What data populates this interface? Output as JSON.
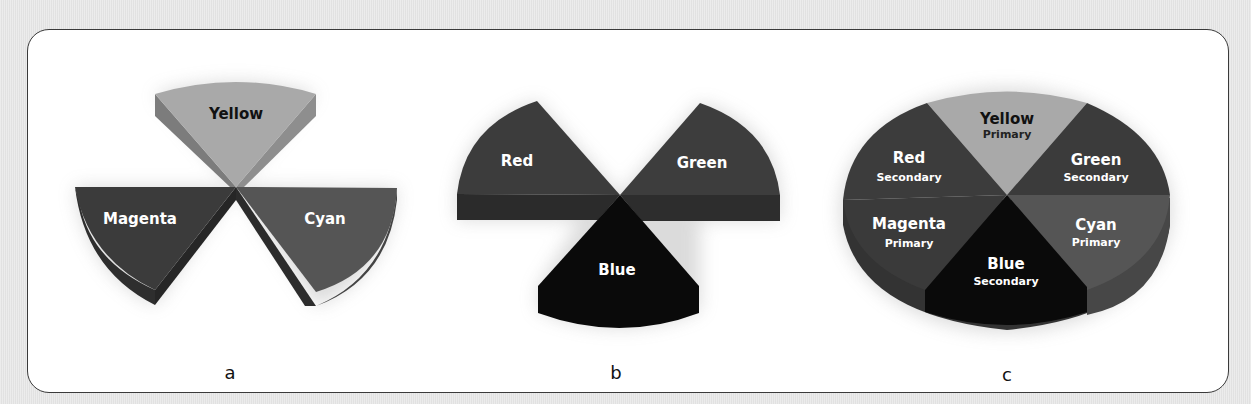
{
  "figure": {
    "panels": [
      {
        "id": "a",
        "caption": "a",
        "description": "Subtractive primaries as 3D pie wedges",
        "wedges": [
          {
            "label": "Yellow",
            "tone": "#a9a9a9"
          },
          {
            "label": "Magenta",
            "tone": "#3b3b3b"
          },
          {
            "label": "Cyan",
            "tone": "#555555"
          }
        ]
      },
      {
        "id": "b",
        "caption": "b",
        "description": "Additive primaries as wedges",
        "wedges": [
          {
            "label": "Red",
            "tone": "#3c3c3c"
          },
          {
            "label": "Green",
            "tone": "#3d3d3d"
          },
          {
            "label": "Blue",
            "tone": "#0a0a0a"
          }
        ]
      },
      {
        "id": "c",
        "caption": "c",
        "description": "Combined color wheel with primary/secondary labels",
        "wedges": [
          {
            "label": "Yellow",
            "sub": "Primary",
            "tone": "#a9a9a9"
          },
          {
            "label": "Green",
            "sub": "Secondary",
            "tone": "#3b3b3b"
          },
          {
            "label": "Cyan",
            "sub": "Primary",
            "tone": "#555555"
          },
          {
            "label": "Blue",
            "sub": "Secondary",
            "tone": "#0a0a0a"
          },
          {
            "label": "Magenta",
            "sub": "Primary",
            "tone": "#3a3a3a"
          },
          {
            "label": "Red",
            "sub": "Secondary",
            "tone": "#3c3c3c"
          }
        ]
      }
    ]
  }
}
